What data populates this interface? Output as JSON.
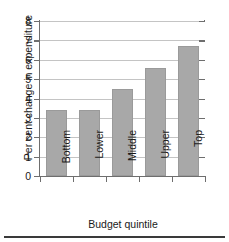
{
  "figure": {
    "top_cut_text": "",
    "bottom_rule": "horizontal-rule"
  },
  "chart_data": {
    "type": "bar",
    "title": "",
    "xlabel": "Budget quintile",
    "ylabel": "Per cent change in expenditure",
    "categories": [
      "Bottom",
      "Lower",
      "Middle",
      "Upper",
      "Top"
    ],
    "values": [
      3.4,
      3.4,
      4.5,
      5.6,
      6.7
    ],
    "ylim": [
      0,
      8
    ],
    "ytick_labels": [
      "0",
      "1",
      "2",
      "3",
      "4",
      "5",
      "6",
      "7",
      "8"
    ],
    "ytick_values": [
      0,
      1,
      2,
      3,
      4,
      5,
      6,
      7,
      8
    ],
    "grid": "horizontal",
    "legend": "none",
    "bar_color": "#a8a8a8",
    "axis_color": "#6e6e6e",
    "grid_color": "#c4c4c4",
    "category_label_rotation": "90"
  }
}
